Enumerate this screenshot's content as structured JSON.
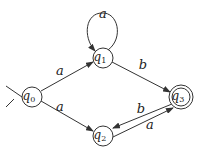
{
  "diagram": {
    "type": "finite-automaton",
    "colors": {
      "stroke": "#333333",
      "text": "#222222",
      "background": "#ffffff"
    },
    "states": [
      {
        "id": "q0",
        "base": "q",
        "sub": "0",
        "start": true,
        "accept": false
      },
      {
        "id": "q1",
        "base": "q",
        "sub": "1",
        "start": false,
        "accept": false
      },
      {
        "id": "q2",
        "base": "q",
        "sub": "2",
        "start": false,
        "accept": false
      },
      {
        "id": "q3",
        "base": "q",
        "sub": "3",
        "start": false,
        "accept": true
      }
    ],
    "transitions": [
      {
        "from": "q0",
        "to": "q1",
        "label": "a"
      },
      {
        "from": "q0",
        "to": "q2",
        "label": "a"
      },
      {
        "from": "q1",
        "to": "q1",
        "label": "a"
      },
      {
        "from": "q1",
        "to": "q3",
        "label": "b"
      },
      {
        "from": "q3",
        "to": "q2",
        "label": "b"
      },
      {
        "from": "q2",
        "to": "q3",
        "label": "a"
      }
    ]
  }
}
